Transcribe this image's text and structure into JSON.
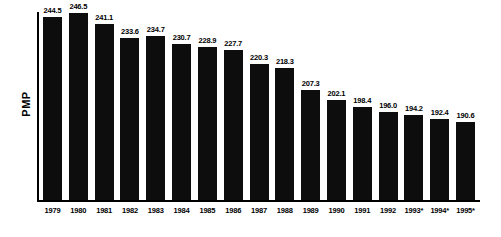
{
  "figure": {
    "ylabel": "PMP",
    "colors": {
      "background": "#ffffff",
      "bar": "#0d0d0d",
      "axis": "#000000",
      "text": "#000000"
    }
  },
  "chart_data": {
    "type": "bar",
    "title": "",
    "xlabel": "",
    "ylabel": "PMP",
    "categories": [
      "1979",
      "1980",
      "1981",
      "1982",
      "1983",
      "1984",
      "1985",
      "1986",
      "1987",
      "1988",
      "1989",
      "1990",
      "1991",
      "1992",
      "1993*",
      "1994*",
      "1995*"
    ],
    "values": [
      244.5,
      246.5,
      241.1,
      233.6,
      234.7,
      230.7,
      228.9,
      227.7,
      220.3,
      218.3,
      207.3,
      202.1,
      198.4,
      196.0,
      194.2,
      192.4,
      190.6
    ],
    "value_labels": [
      "244.5",
      "246.5",
      "241.1",
      "233.6",
      "234.7",
      "230.7",
      "228.9",
      "227.7",
      "220.3",
      "218.3",
      "207.3",
      "202.1",
      "198.4",
      "196.0",
      "194.2",
      "192.4",
      "190.6"
    ],
    "ylim": [
      151,
      247
    ],
    "grid": false,
    "legend": false
  }
}
